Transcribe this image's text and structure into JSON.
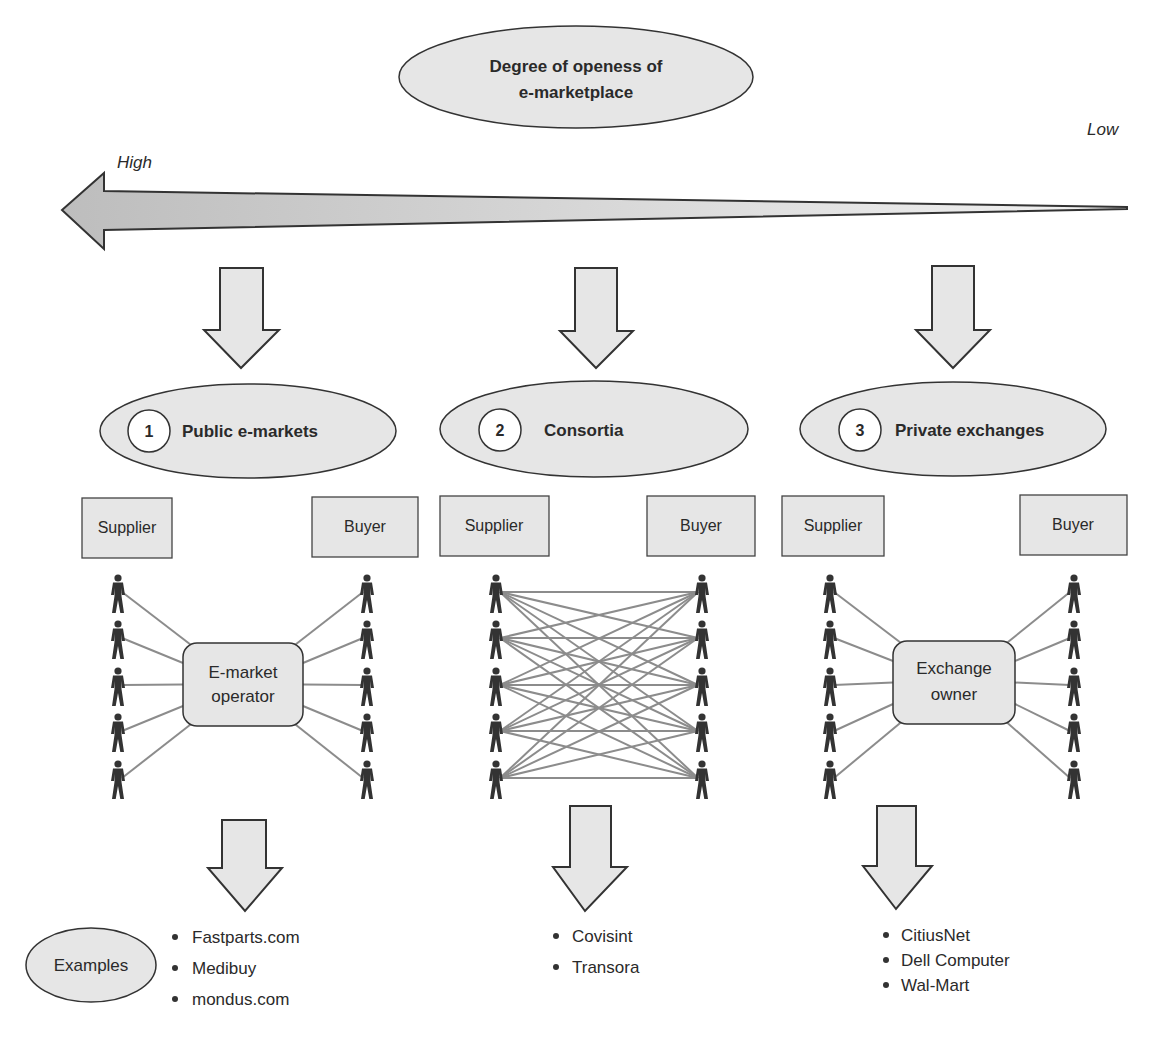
{
  "header": {
    "title_line1": "Degree of openess of",
    "title_line2": "e-marketplace"
  },
  "scale": {
    "high_label": "High",
    "low_label": "Low"
  },
  "columns": [
    {
      "number": "1",
      "title": "Public e-markets",
      "supplier_label": "Supplier",
      "buyer_label": "Buyer",
      "hub_line1": "E-market",
      "hub_line2": "operator",
      "topology": "hub",
      "examples": [
        "Fastparts.com",
        "Medibuy",
        "mondus.com"
      ]
    },
    {
      "number": "2",
      "title": "Consortia",
      "supplier_label": "Supplier",
      "buyer_label": "Buyer",
      "hub_line1": "",
      "hub_line2": "",
      "topology": "mesh",
      "examples": [
        "Covisint",
        "Transora"
      ]
    },
    {
      "number": "3",
      "title": "Private exchanges",
      "supplier_label": "Supplier",
      "buyer_label": "Buyer",
      "hub_line1": "Exchange",
      "hub_line2": "owner",
      "topology": "hub",
      "examples": [
        "CitiusNet",
        "Dell Computer",
        "Wal-Mart"
      ]
    }
  ],
  "examples_label": "Examples",
  "colors": {
    "fill": "#e6e6e6",
    "stroke": "#333333",
    "line": "#8c8c8c",
    "person": "#333333"
  }
}
